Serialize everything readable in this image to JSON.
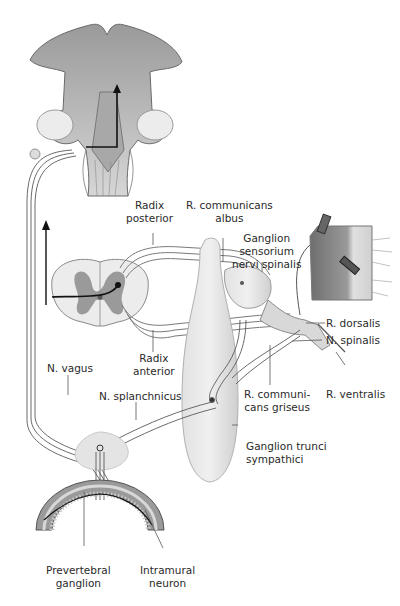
{
  "diagram": {
    "type": "anatomy",
    "colors": {
      "background": "#ffffff",
      "tissue_light": "#e9e9e9",
      "tissue_mid": "#cfcfcf",
      "tissue_dark": "#8a8a8a",
      "grey_matter": "#9a9a9a",
      "nerve_line": "#3a3a3a",
      "pathway_arrow": "#111111",
      "label_text": "#2a2a2a"
    },
    "structures": [
      "brainstem",
      "spinal-cord-cross-section",
      "ganglion-sensorium-nervi-spinalis",
      "ganglion-trunci-sympathici",
      "prevertebral-ganglion",
      "gut-wall-section",
      "muscle-skin-block"
    ]
  },
  "labels": {
    "radix_posterior": [
      "Radix",
      "posterior"
    ],
    "r_communicans_albus": [
      "R. communicans",
      "albus"
    ],
    "ganglion_sensorium": [
      "Ganglion",
      "sensorium",
      "nervi spinalis"
    ],
    "r_dorsalis": "R. dorsalis",
    "n_spinalis": "N. spinalis",
    "radix_anterior": [
      "Radix",
      "anterior"
    ],
    "n_vagus": "N. vagus",
    "n_splanchnicus": "N. splanchnicus",
    "r_communicans_griseus": [
      "R. communi-",
      "cans griseus"
    ],
    "r_ventralis": "R. ventralis",
    "ganglion_trunci": [
      "Ganglion trunci",
      "sympathici"
    ],
    "prevertebral_ganglion": [
      "Prevertebral",
      "ganglion"
    ],
    "intramural_neuron": [
      "Intramural",
      "neuron"
    ]
  }
}
